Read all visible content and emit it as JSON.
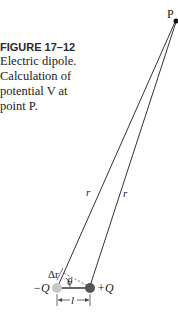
{
  "caption": {
    "figure_label": "FIGURE 17–12",
    "text": "Electric dipole. Calculation of potential V at point P."
  },
  "diagram": {
    "point_label": "P",
    "left_line_label": "r",
    "right_line_label": "r",
    "delta_r_label": "Δr",
    "angle_label": "θ",
    "neg_charge_label": "−Q",
    "pos_charge_label": "+Q",
    "separation_label": "l",
    "colors": {
      "line": "#333333",
      "neg_charge": "#c8c8c8",
      "pos_charge": "#555555",
      "point": "#111111"
    }
  }
}
